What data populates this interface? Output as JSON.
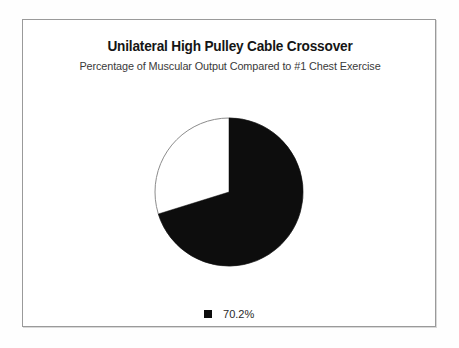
{
  "chart": {
    "title": "Unilateral High Pulley Cable Crossover",
    "subtitle": "Percentage of Muscular Output Compared to #1 Chest Exercise",
    "legend": [
      {
        "label": "70.2%",
        "color": "#0d0d0d",
        "swatch_name": "legend-swatch-black"
      }
    ]
  },
  "chart_data": {
    "type": "pie",
    "title": "Unilateral High Pulley Cable Crossover",
    "subtitle": "Percentage of Muscular Output Compared to #1 Chest Exercise",
    "categories": [
      "70.2%",
      ""
    ],
    "values": [
      70.2,
      29.8
    ],
    "colors": [
      "#0d0d0d",
      "#ffffff"
    ],
    "labels_shown": [
      "70.2%"
    ],
    "start_angle_deg": 0,
    "direction": "clockwise",
    "slice_outline_color": "#8c8c8c",
    "legend": [
      "70.2%"
    ],
    "legend_position": "bottom",
    "grid": false,
    "xlabel": "",
    "ylabel": ""
  },
  "frame": {
    "border_color": "#9a9a9a",
    "background": "#ffffff"
  }
}
